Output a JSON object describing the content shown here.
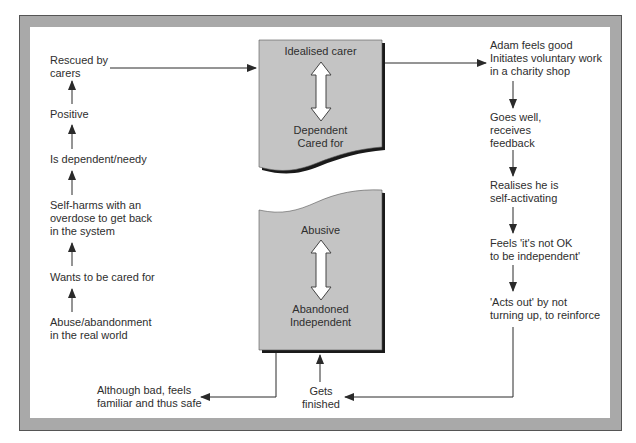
{
  "diagram": {
    "type": "cycle-flow",
    "top_card": {
      "top_label": "Idealised carer",
      "bottom_label_lines": [
        "Dependent",
        "Cared for"
      ],
      "arrow": "double-vertical-arrow"
    },
    "bottom_card": {
      "top_label": "Abusive",
      "bottom_label_lines": [
        "Abandoned",
        "Independent"
      ],
      "arrow": "double-vertical-arrow"
    },
    "left_column": [
      {
        "lines": [
          "Rescued by",
          "carers"
        ]
      },
      {
        "lines": [
          "Positive"
        ]
      },
      {
        "lines": [
          "Is dependent/needy"
        ]
      },
      {
        "lines": [
          "Self-harms with an",
          "overdose to get back",
          "in the system"
        ]
      },
      {
        "lines": [
          "Wants to be cared for"
        ]
      },
      {
        "lines": [
          "Abuse/abandonment",
          "in the real world"
        ]
      }
    ],
    "right_column": [
      {
        "lines": [
          "Adam feels good",
          "Initiates voluntary work",
          "in a charity shop"
        ]
      },
      {
        "lines": [
          "Goes well,",
          "receives",
          "feedback"
        ]
      },
      {
        "lines": [
          "Realises he is",
          "self-activating"
        ]
      },
      {
        "lines": [
          "Feels 'it's not OK",
          "to be independent'"
        ]
      },
      {
        "lines": [
          "'Acts out' by not",
          "turning up, to reinforce"
        ]
      }
    ],
    "bottom_labels": {
      "left": {
        "lines": [
          "Although bad, feels",
          "familiar and thus safe"
        ]
      },
      "center": {
        "lines": [
          "Gets",
          "finished"
        ]
      }
    },
    "colors": {
      "card_fill": "#c4c4c4",
      "card_shadow": "#1a1a1a",
      "frame_band": "#a9a9a9",
      "line": "#2a2a2a",
      "arrow_fill": "#ffffff"
    }
  }
}
